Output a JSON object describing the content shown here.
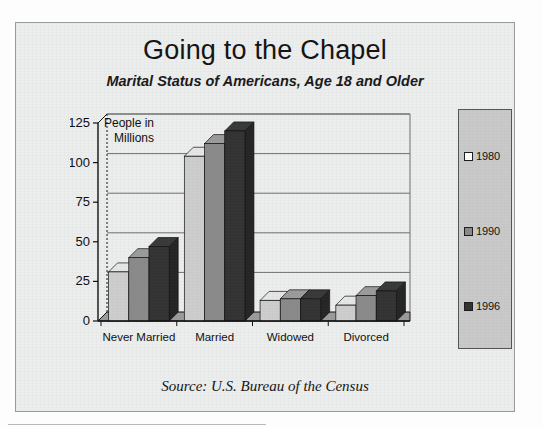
{
  "title": "Going to the Chapel",
  "subtitle": "Marital Status of Americans, Age 18 and Older",
  "source": "Source:  U.S. Bureau of the Census",
  "axis_note_line1": "People in",
  "axis_note_line2": "Millions",
  "colors": {
    "frame_background": "#eceded",
    "legend_background": "#c9c9c9",
    "series_1980": "#cdcdcd",
    "series_1990": "#8a8a8a",
    "series_1996": "#333333",
    "axis": "#101010",
    "gridline": "#6f6f6f"
  },
  "legend": {
    "position": "right",
    "items": [
      {
        "label": "1980",
        "color": "#ffffff"
      },
      {
        "label": "1990",
        "color": "#8a8a8a"
      },
      {
        "label": "1996",
        "color": "#333333"
      }
    ]
  },
  "chart_data": {
    "type": "bar",
    "title": "Going to the Chapel",
    "subtitle": "Marital Status of Americans, Age 18 and Older",
    "xlabel": "",
    "ylabel": "People in Millions",
    "ylim": [
      0,
      125
    ],
    "yticks": [
      0,
      25,
      50,
      75,
      100,
      125
    ],
    "ytick_labels": [
      "0",
      "25",
      "50",
      "75",
      "100",
      "125"
    ],
    "grid": true,
    "legend_position": "right",
    "style": "3d-column",
    "categories": [
      "Never Married",
      "Married",
      "Widowed",
      "Divorced"
    ],
    "series": [
      {
        "name": "1980",
        "color": "#cdcdcd",
        "values": [
          31,
          104,
          13,
          10
        ]
      },
      {
        "name": "1990",
        "color": "#8a8a8a",
        "values": [
          40,
          112,
          14,
          16
        ]
      },
      {
        "name": "1996",
        "color": "#333333",
        "values": [
          47,
          120,
          14,
          19
        ]
      }
    ]
  }
}
